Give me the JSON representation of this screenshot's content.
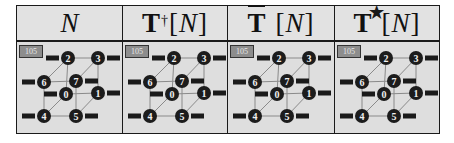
{
  "headers": [
    {
      "base": "",
      "var": "N",
      "mod": "none"
    },
    {
      "base": "T",
      "var": "N",
      "mod": "dagger",
      "sup": "†"
    },
    {
      "base": "T",
      "var": "N",
      "mod": "bar"
    },
    {
      "base": "T",
      "var": "N",
      "mod": "star",
      "sup": "★"
    }
  ],
  "bracket_open": "[",
  "bracket_close": "]",
  "tag_value": "105",
  "cube": {
    "nodes": [
      {
        "id": "0",
        "x": 49,
        "y": 52,
        "label_side": "left"
      },
      {
        "id": "1",
        "x": 81,
        "y": 51,
        "label_side": "right"
      },
      {
        "id": "2",
        "x": 51,
        "y": 16,
        "label_side": "left"
      },
      {
        "id": "3",
        "x": 81,
        "y": 16,
        "label_side": "right"
      },
      {
        "id": "4",
        "x": 27,
        "y": 74,
        "label_side": "left"
      },
      {
        "id": "5",
        "x": 59,
        "y": 74,
        "label_side": "right"
      },
      {
        "id": "6",
        "x": 27,
        "y": 40,
        "label_side": "left"
      },
      {
        "id": "7",
        "x": 59,
        "y": 39,
        "label_side": "right"
      }
    ],
    "edges": [
      [
        "2",
        "3"
      ],
      [
        "2",
        "0"
      ],
      [
        "3",
        "1"
      ],
      [
        "0",
        "1"
      ],
      [
        "6",
        "7"
      ],
      [
        "6",
        "4"
      ],
      [
        "7",
        "5"
      ],
      [
        "4",
        "5"
      ],
      [
        "2",
        "6"
      ],
      [
        "3",
        "7"
      ],
      [
        "0",
        "4"
      ],
      [
        "1",
        "5"
      ]
    ]
  },
  "colors": {
    "node_fill": "#1c1c1c",
    "node_text": "#f0f0f0",
    "edge": "#8a8a8a",
    "label_bar": "#1a1a1a",
    "cell_bg": "#dedede",
    "tag_fill": "#8d8d8d"
  }
}
